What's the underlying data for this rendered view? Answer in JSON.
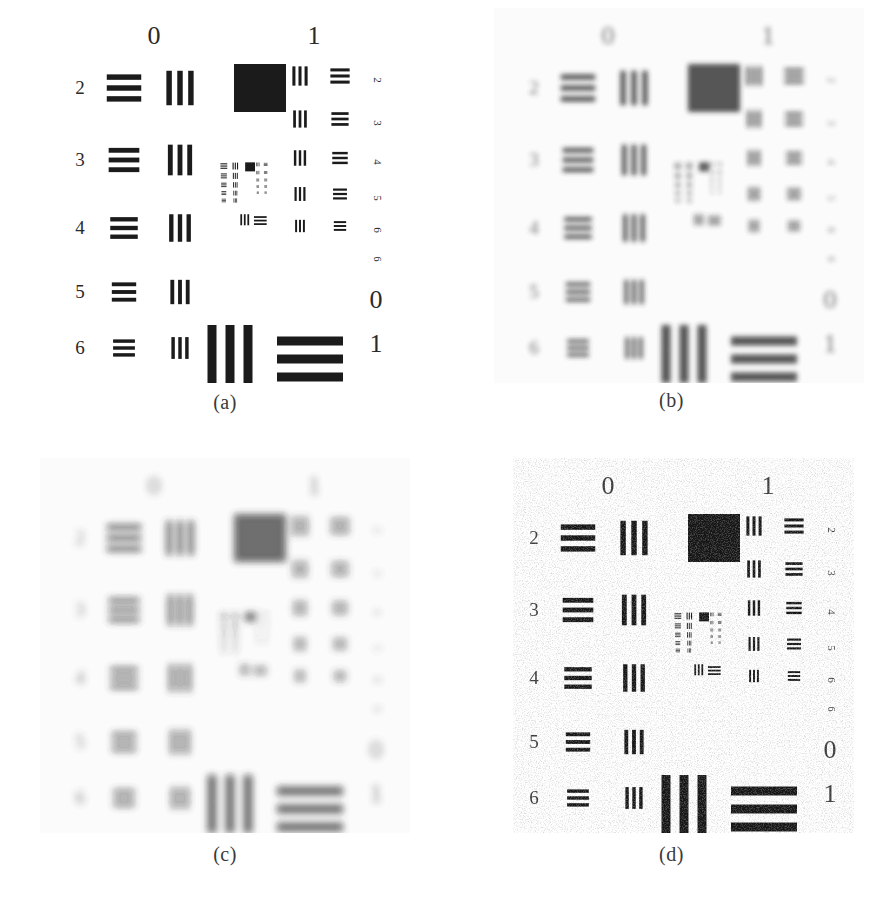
{
  "figure": {
    "layout": "2x2",
    "background_color": "#ffffff",
    "ink_color": "#1a1a1a"
  },
  "panels": [
    {
      "id": "a",
      "caption": "(a)",
      "description": "Original sharp USAF 1951 resolution test chart",
      "condition": "original",
      "blur_px": 0,
      "noise": 0,
      "contrast": 1.0
    },
    {
      "id": "b",
      "caption": "(b)",
      "description": "Blurred / degraded version of the test chart",
      "condition": "blurred",
      "blur_px": 2.4,
      "noise": 0.04,
      "contrast": 0.78
    },
    {
      "id": "c",
      "caption": "(c)",
      "description": "More heavily blurred version of the test chart",
      "condition": "blurred-heavier",
      "blur_px": 3.6,
      "noise": 0.03,
      "contrast": 0.7
    },
    {
      "id": "d",
      "caption": "(d)",
      "description": "Restored / deblurred version with residual noise",
      "condition": "restored",
      "blur_px": 0.55,
      "noise": 0.33,
      "contrast": 0.95
    }
  ],
  "chart_data": {
    "type": "table",
    "group_labels_top": [
      "0",
      "1"
    ],
    "group_labels_bottom_right": [
      "0",
      "1"
    ],
    "element_labels_left": [
      "2",
      "3",
      "4",
      "5",
      "6"
    ],
    "element_labels_right": [
      "1",
      "2",
      "3",
      "4",
      "5",
      "6"
    ],
    "bars_per_element": 3,
    "group0": {
      "label": "0",
      "elements": [
        {
          "element": 1,
          "lp_per_mm": 1.0,
          "orientation": [
            "vertical",
            "horizontal"
          ],
          "position": "bottom"
        },
        {
          "element": 2,
          "lp_per_mm": 1.12,
          "orientation": [
            "horizontal",
            "vertical"
          ],
          "position": "row-2"
        },
        {
          "element": 3,
          "lp_per_mm": 1.26,
          "orientation": [
            "horizontal",
            "vertical"
          ],
          "position": "row-3"
        },
        {
          "element": 4,
          "lp_per_mm": 1.41,
          "orientation": [
            "horizontal",
            "vertical"
          ],
          "position": "row-4"
        },
        {
          "element": 5,
          "lp_per_mm": 1.59,
          "orientation": [
            "horizontal",
            "vertical"
          ],
          "position": "row-5"
        },
        {
          "element": 6,
          "lp_per_mm": 1.78,
          "orientation": [
            "horizontal",
            "vertical"
          ],
          "position": "row-6"
        }
      ]
    },
    "group1": {
      "label": "1",
      "elements": [
        {
          "element": 1,
          "lp_per_mm": 2.0,
          "orientation": [
            "horizontal"
          ],
          "position": "bottom-right"
        },
        {
          "element": 2,
          "lp_per_mm": 2.24,
          "orientation": [
            "vertical",
            "horizontal"
          ],
          "position": "row-1"
        },
        {
          "element": 3,
          "lp_per_mm": 2.52,
          "orientation": [
            "vertical",
            "horizontal"
          ],
          "position": "row-2"
        },
        {
          "element": 4,
          "lp_per_mm": 2.83,
          "orientation": [
            "vertical",
            "horizontal"
          ],
          "position": "row-3"
        },
        {
          "element": 5,
          "lp_per_mm": 3.17,
          "orientation": [
            "vertical",
            "horizontal"
          ],
          "position": "row-4"
        },
        {
          "element": 6,
          "lp_per_mm": 3.56,
          "orientation": [
            "vertical",
            "horizontal"
          ],
          "position": "row-5"
        }
      ]
    },
    "solid_square": {
      "present": true,
      "position": "top-centre-right",
      "color": "#151515"
    },
    "nested_miniature": {
      "present": true,
      "position": "centre",
      "scale": 0.2
    }
  }
}
